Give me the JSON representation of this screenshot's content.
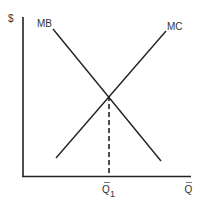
{
  "diagram": {
    "type": "supply-demand style: marginal benefit vs marginal cost",
    "y_axis_label": "$",
    "x_axis_label": "Q",
    "x_axis_label_bar": "‾",
    "equilibrium_label": "Q",
    "equilibrium_subscript": "1",
    "curves": [
      {
        "name": "MB",
        "label": "MB",
        "slope": "downward",
        "from": [
          53,
          29
        ],
        "to": [
          161,
          161
        ]
      },
      {
        "name": "MC",
        "label": "MC",
        "slope": "upward",
        "from": [
          56,
          158
        ],
        "to": [
          166,
          31
        ]
      }
    ],
    "intersection": [
      108,
      96
    ],
    "colors": {
      "line": "#222222",
      "text": "#333333",
      "background": "#ffffff"
    }
  }
}
